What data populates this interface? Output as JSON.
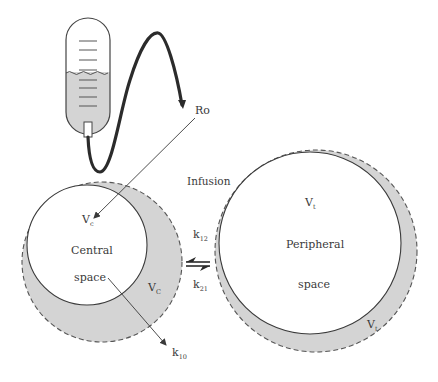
{
  "diagram": {
    "labels": {
      "rate": "Ro",
      "infusion": "Infusion",
      "central_volume_inner": {
        "main": "V",
        "sub": "c"
      },
      "central_volume_outer": {
        "main": "V",
        "sub": "C"
      },
      "central_name_line1": "Central",
      "central_name_line2": "space",
      "peripheral_volume_inner": {
        "main": "V",
        "sub": "t"
      },
      "peripheral_volume_outer": {
        "main": "V",
        "sub": "t"
      },
      "peripheral_name_line1": "Peripheral",
      "peripheral_name_line2": "space",
      "k12": {
        "main": "k",
        "sub": "12"
      },
      "k21": {
        "main": "k",
        "sub": "21"
      },
      "k10": {
        "main": "k",
        "sub": "10"
      }
    },
    "colors": {
      "shade": "#d4d4d4",
      "line": "#3a3a3a",
      "tube": "#2b2b2b",
      "background": "#ffffff"
    },
    "nodes": [
      {
        "id": "iv-bag",
        "type": "infusion bag"
      },
      {
        "id": "central",
        "label": "Central space"
      },
      {
        "id": "peripheral",
        "label": "Peripheral space"
      }
    ],
    "edges": [
      {
        "from": "iv-bag",
        "to": "central",
        "label": "Ro"
      },
      {
        "from": "central",
        "to": "peripheral",
        "label": "k12"
      },
      {
        "from": "peripheral",
        "to": "central",
        "label": "k21"
      },
      {
        "from": "central",
        "to": "elimination",
        "label": "k10"
      }
    ]
  }
}
